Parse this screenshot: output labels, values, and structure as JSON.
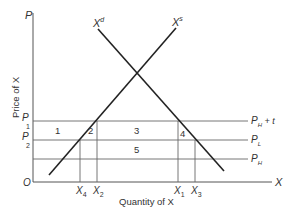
{
  "diagram": {
    "type": "supply-demand",
    "y_axis": {
      "letter": "P",
      "title": "Price of X"
    },
    "x_axis": {
      "letter": "X",
      "title": "Quantity of X"
    },
    "origin": "O",
    "curves": {
      "demand": {
        "base": "X",
        "sup": "d"
      },
      "supply": {
        "base": "X",
        "sup": "s"
      }
    },
    "price_levels": [
      {
        "left_base": "P",
        "left_sub": "1",
        "right_base": "P",
        "right_sub": "H",
        "right_suffix": " + t"
      },
      {
        "left_base": "P",
        "left_sub": "2",
        "right_base": "P",
        "right_sub": "L",
        "right_suffix": ""
      },
      {
        "left_base": "",
        "left_sub": "",
        "right_base": "P",
        "right_sub": "H",
        "right_suffix": ""
      }
    ],
    "quantities": [
      {
        "base": "X",
        "sub": "4"
      },
      {
        "base": "X",
        "sub": "2"
      },
      {
        "base": "X",
        "sub": "1"
      },
      {
        "base": "X",
        "sub": "3"
      }
    ],
    "areas": [
      "1",
      "2",
      "3",
      "4",
      "5"
    ],
    "colors": {
      "line": "#333333",
      "thin_line": "#555555",
      "background": "#ffffff"
    }
  }
}
